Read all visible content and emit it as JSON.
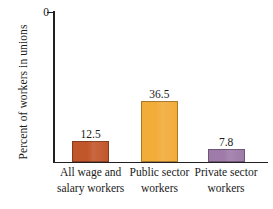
{
  "chart_data": {
    "type": "bar",
    "title": "",
    "xlabel": "",
    "ylabel": "Percent of workers in unions",
    "categories": [
      "All wage and salary workers",
      "Public sector workers",
      "Private sector workers"
    ],
    "category_lines": [
      [
        "All wage and",
        "salary workers"
      ],
      [
        "Public sector",
        "workers"
      ],
      [
        "Private sector",
        "workers"
      ]
    ],
    "values": [
      12.5,
      36.5,
      7.8
    ],
    "value_labels": [
      "12.5",
      "36.5",
      "7.8"
    ],
    "bar_colors": [
      "#C2562B",
      "#F2AC3A",
      "#9E7BA8"
    ],
    "ylim": [
      0,
      90
    ],
    "ytick_step": 10,
    "ytick_labels": [
      "90",
      "80",
      "70",
      "60",
      "50",
      "40",
      "30",
      "20",
      "10",
      "0"
    ],
    "ytick_values": [
      90,
      80,
      70,
      60,
      50,
      40,
      30,
      20,
      10,
      0
    ],
    "grid": false,
    "legend": false,
    "legend_position": "none",
    "axis_color": "#231F20",
    "background_color": "#FFFFFF"
  }
}
